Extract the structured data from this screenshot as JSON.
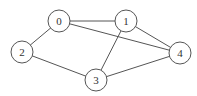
{
  "graph": {
    "nodes": [
      {
        "id": "0",
        "x": 59,
        "y": 21
      },
      {
        "id": "1",
        "x": 126,
        "y": 21
      },
      {
        "id": "2",
        "x": 22,
        "y": 52
      },
      {
        "id": "3",
        "x": 96,
        "y": 80
      },
      {
        "id": "4",
        "x": 180,
        "y": 53
      }
    ],
    "edges": [
      [
        "0",
        "1"
      ],
      [
        "0",
        "2"
      ],
      [
        "0",
        "4"
      ],
      [
        "1",
        "3"
      ],
      [
        "1",
        "4"
      ],
      [
        "2",
        "3"
      ],
      [
        "3",
        "4"
      ]
    ],
    "node_radius": 11
  }
}
